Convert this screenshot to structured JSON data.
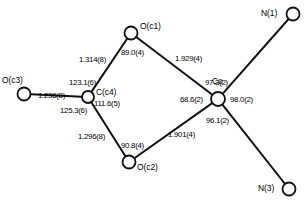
{
  "diagram": {
    "type": "crystal-structure-bond-diagram",
    "title": "",
    "stroke_color": "#111111",
    "node_fill": "#ffffff",
    "atoms": [
      {
        "id": "Oc3",
        "label": "O(c3)",
        "x": 24,
        "y": 94,
        "r": 6.5,
        "label_dx": -22,
        "label_dy": -18
      },
      {
        "id": "Cc4",
        "label": "C(c4)",
        "x": 88,
        "y": 97,
        "r": 6.0,
        "label_dx": 8,
        "label_dy": -9
      },
      {
        "id": "Oc1",
        "label": "O(c1)",
        "x": 131,
        "y": 33,
        "r": 6.5,
        "label_dx": 9,
        "label_dy": -11
      },
      {
        "id": "Oc2",
        "label": "O(c2)",
        "x": 129,
        "y": 162,
        "r": 6.5,
        "label_dx": 8,
        "label_dy": 1
      },
      {
        "id": "Co",
        "label": "Co",
        "x": 218,
        "y": 99,
        "r": 7.0,
        "label_dx": -6,
        "label_dy": -22
      },
      {
        "id": "N1",
        "label": "N(1)",
        "x": 293,
        "y": 14,
        "r": 6.5,
        "label_dx": -32,
        "label_dy": -5
      },
      {
        "id": "N3",
        "label": "N(3)",
        "x": 289,
        "y": 189,
        "r": 6.5,
        "label_dx": -31,
        "label_dy": -5
      }
    ],
    "bonds": [
      {
        "from": "Oc3",
        "to": "Cc4"
      },
      {
        "from": "Cc4",
        "to": "Oc1"
      },
      {
        "from": "Cc4",
        "to": "Oc2"
      },
      {
        "from": "Oc1",
        "to": "Co"
      },
      {
        "from": "Oc2",
        "to": "Co"
      },
      {
        "from": "Co",
        "to": "N1"
      },
      {
        "from": "Co",
        "to": "N3"
      }
    ],
    "bond_lengths": [
      {
        "name": "Oc3-Cc4",
        "value": "1.236(8)",
        "x": 38,
        "y": 92
      },
      {
        "name": "Cc4-Oc1",
        "value": "1.314(8)",
        "x": 79,
        "y": 56
      },
      {
        "name": "Cc4-Oc2",
        "value": "1.296(8)",
        "x": 78,
        "y": 133
      },
      {
        "name": "Oc1-Co",
        "value": "1.929(4)",
        "x": 175,
        "y": 55
      },
      {
        "name": "Oc2-Co",
        "value": "1.901(4)",
        "x": 168,
        "y": 131
      }
    ],
    "bond_angles": [
      {
        "name": "Oc1-Cc4-Oc3",
        "value": "123.1(6)",
        "x": 69,
        "y": 79
      },
      {
        "name": "Oc1-Cc4-Oc2",
        "value": "111.6(5)",
        "x": 94,
        "y": 100
      },
      {
        "name": "Oc3-Cc4-Oc2",
        "value": "125.3(6)",
        "x": 60,
        "y": 107
      },
      {
        "name": "Cc4-Oc1-Co",
        "value": "89.0(4)",
        "x": 121,
        "y": 49
      },
      {
        "name": "Cc4-Oc2-Co",
        "value": "90.8(4)",
        "x": 121,
        "y": 142
      },
      {
        "name": "Oc1-Co-N1",
        "value": "97.3(2)",
        "x": 205,
        "y": 79
      },
      {
        "name": "Oc1-Co-Oc2",
        "value": "68.6(2)",
        "x": 180,
        "y": 96
      },
      {
        "name": "N1-Co-N3",
        "value": "98.0(2)",
        "x": 230,
        "y": 96
      },
      {
        "name": "Oc2-Co-N3",
        "value": "96.1(2)",
        "x": 206,
        "y": 117
      }
    ]
  }
}
